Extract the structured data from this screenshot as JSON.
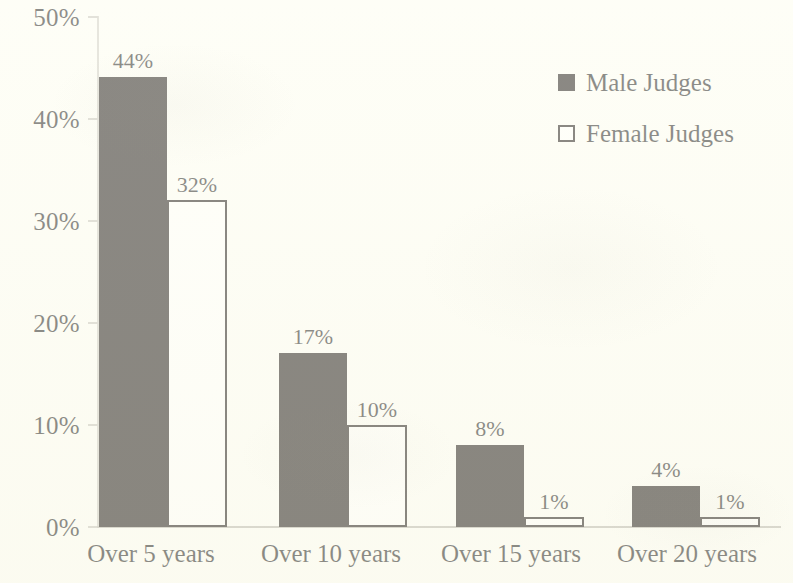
{
  "chart_data": {
    "type": "bar",
    "title": "",
    "subtitle": "",
    "xlabel": "",
    "ylabel": "",
    "categories": [
      "Over 5 years",
      "Over 10 years",
      "Over 15 years",
      "Over 20 years"
    ],
    "series": [
      {
        "name": "Male Judges",
        "values": [
          44,
          17,
          8,
          4
        ],
        "labels": [
          "44%",
          "17%",
          "8%",
          "4%"
        ],
        "color": "#17120e",
        "swatch": "filled"
      },
      {
        "name": "Female Judges",
        "values": [
          32,
          10,
          1,
          1
        ],
        "labels": [
          "32%",
          "10%",
          "1%",
          "1%"
        ],
        "color": "#fffffa",
        "swatch": "hollow"
      }
    ],
    "ylim": [
      0,
      50
    ],
    "y_tick_values": [
      50,
      40,
      30,
      20,
      10,
      0
    ],
    "y_tick_labels": [
      "50%",
      "40%",
      "30%",
      "20%",
      "10%",
      "0%"
    ],
    "grid": false,
    "legend_position": "top-right",
    "value_labels_shown": true,
    "value_label_unit": "%"
  },
  "legend": {
    "entries": [
      {
        "label": "Male Judges",
        "swatch": "filled"
      },
      {
        "label": "Female Judges",
        "swatch": "hollow"
      }
    ]
  },
  "colors": {
    "background": "#fdfdf3",
    "ink": "#17120e",
    "axis": "#c7c5ba"
  }
}
